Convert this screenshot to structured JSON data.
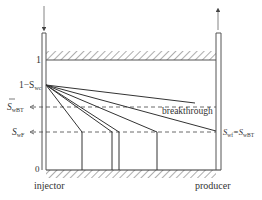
{
  "diagram": {
    "colors": {
      "line": "#333333",
      "pipe": "#555555",
      "hatch": "#777777",
      "dash": "#444444",
      "text": "#333333"
    },
    "y_axis": {
      "tick_top": "1",
      "tick_swc": "1−S",
      "tick_swc_sub": "wc",
      "tick_swbt": "S",
      "tick_swbt_sub": "wBT",
      "tick_swf": "S",
      "tick_swf_sub": "wF",
      "tick_zero": "0"
    },
    "annotations": {
      "breakthrough": "breakthrough",
      "producer_eq_left": "S",
      "producer_eq_left_sub": "wf",
      "producer_eq_mid": "=S",
      "producer_eq_right_sub": "wBT"
    },
    "wells": {
      "injector": "injector",
      "producer": "producer"
    },
    "profiles": [
      {
        "name": "profile-1",
        "front_x": 82
      },
      {
        "name": "profile-2",
        "front_x": 112
      },
      {
        "name": "profile-3",
        "front_x": 119
      },
      {
        "name": "profile-4",
        "front_x": 157
      },
      {
        "name": "profile-breakthrough",
        "front_x": 216
      }
    ]
  }
}
